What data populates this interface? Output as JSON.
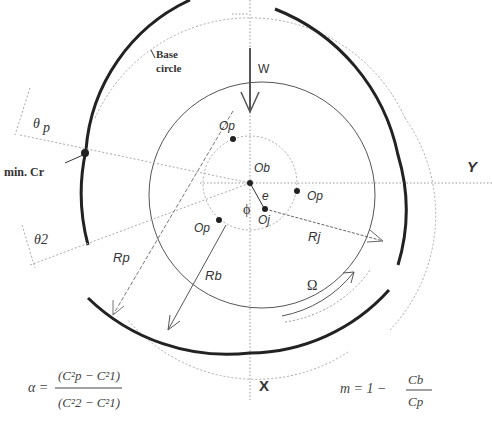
{
  "labels": {
    "base_circle_line1": "Base",
    "base_circle_line2": "circle",
    "load": "W",
    "theta_p": "θ",
    "theta_p_sub": "p",
    "min_cr": "min. Cr",
    "Y": "Y",
    "X": "X",
    "Ob": "Ob",
    "Oj": "Oj",
    "Op_top": "Op",
    "Op_right": "Op",
    "Op_left": "Op",
    "e": "e",
    "phi": "ϕ",
    "theta2": "θ2",
    "Rp": "Rp",
    "Rb": "Rb",
    "Rj": "Rj",
    "Omega": "Ω"
  },
  "equations": {
    "alpha": {
      "lhs": "α =",
      "num": "(C²p − C²1)",
      "den": "(C²2 − C²1)"
    },
    "m": {
      "lhs": "m = 1 −",
      "num": "Cb",
      "den": "Cp"
    }
  },
  "colors": {
    "line": "#444444",
    "thick": "#222222",
    "dotted": "#888888"
  }
}
